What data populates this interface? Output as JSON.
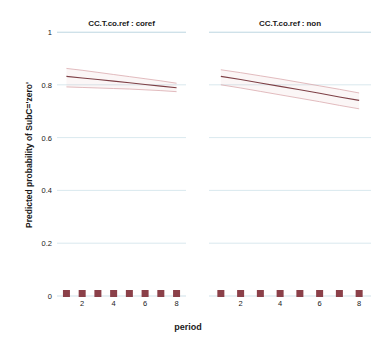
{
  "chart_data": {
    "type": "line",
    "title": "",
    "xlabel": "period",
    "ylabel": "Predicted probability of SubC='zero'",
    "xlim": [
      0.4,
      8.6
    ],
    "ylim": [
      0,
      1
    ],
    "xticks": [
      2,
      4,
      6,
      8
    ],
    "xtick_labels": [
      "2",
      "4",
      "6",
      "8"
    ],
    "yticks": [
      0,
      0.2,
      0.4,
      0.6,
      0.8,
      1
    ],
    "ytick_labels": [
      "0",
      "0.2",
      "0.4",
      "0.6",
      "0.8",
      "1"
    ],
    "grid": true,
    "grid_color": "#cfe2ea",
    "legend": "none",
    "line_color": "#7d3f45",
    "band_color": "#d9a7ab",
    "rug_color": "#8b4049",
    "panel_variable": "CC.T.co.ref",
    "panels": [
      {
        "strip_label": "CC.T.co.ref : coref",
        "x": [
          1,
          2,
          3,
          4,
          5,
          6,
          7,
          8
        ],
        "fit": [
          0.832,
          0.826,
          0.82,
          0.814,
          0.808,
          0.801,
          0.795,
          0.789
        ],
        "upper": [
          0.862,
          0.855,
          0.847,
          0.839,
          0.831,
          0.823,
          0.815,
          0.806
        ],
        "lower": [
          0.792,
          0.79,
          0.788,
          0.786,
          0.784,
          0.781,
          0.778,
          0.774
        ],
        "rug_x": [
          1,
          2,
          3,
          4,
          5,
          6,
          7,
          8
        ]
      },
      {
        "strip_label": "CC.T.co.ref : non",
        "x": [
          1,
          2,
          3,
          4,
          5,
          6,
          7,
          8
        ],
        "fit": [
          0.832,
          0.82,
          0.807,
          0.794,
          0.781,
          0.768,
          0.754,
          0.741
        ],
        "upper": [
          0.857,
          0.846,
          0.834,
          0.822,
          0.809,
          0.796,
          0.783,
          0.769
        ],
        "lower": [
          0.8,
          0.788,
          0.775,
          0.762,
          0.749,
          0.736,
          0.722,
          0.709
        ],
        "rug_x": [
          1,
          2,
          3,
          4,
          5,
          6,
          7,
          8
        ]
      }
    ]
  }
}
